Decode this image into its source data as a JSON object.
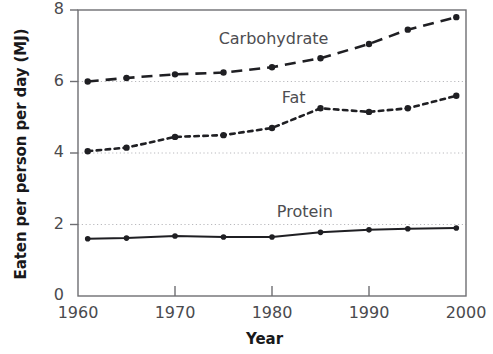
{
  "chart_data": {
    "type": "line",
    "title": "",
    "xlabel": "Year",
    "ylabel": "Eaten per person per day (MJ)",
    "xlim": [
      1960,
      2000
    ],
    "ylim": [
      0,
      8
    ],
    "xticks": [
      1960,
      1970,
      1980,
      1990,
      2000
    ],
    "xtick_labels": [
      "1960",
      "1970",
      "1980",
      "1990",
      "2000"
    ],
    "yticks": [
      0,
      2,
      4,
      6,
      8
    ],
    "ytick_labels": [
      "0",
      "2",
      "4",
      "6",
      "8"
    ],
    "grid": "horizontal dotted gridlines at y = 2, 4 and 6",
    "legend_position": "inline labels next to each series",
    "series": [
      {
        "name": "Carbohydrate",
        "label": "Carbohydrate",
        "style": "dashed",
        "x": [
          1961,
          1965,
          1970,
          1975,
          1980,
          1985,
          1990,
          1994,
          1999
        ],
        "values": [
          6.0,
          6.1,
          6.2,
          6.25,
          6.4,
          6.65,
          7.05,
          7.45,
          7.8
        ]
      },
      {
        "name": "Fat",
        "label": "Fat",
        "style": "dotted",
        "x": [
          1961,
          1965,
          1970,
          1975,
          1980,
          1985,
          1990,
          1994,
          1999
        ],
        "values": [
          4.05,
          4.15,
          4.45,
          4.5,
          4.7,
          5.25,
          5.15,
          5.25,
          5.6
        ]
      },
      {
        "name": "Protein",
        "label": "Protein",
        "style": "solid",
        "x": [
          1961,
          1965,
          1970,
          1975,
          1980,
          1985,
          1990,
          1994,
          1999
        ],
        "values": [
          1.6,
          1.62,
          1.68,
          1.65,
          1.65,
          1.78,
          1.85,
          1.88,
          1.9
        ]
      }
    ],
    "colors": {
      "line": "#1f1f23",
      "gridline": "#b9b9bd",
      "axis": "#6e6e72",
      "text": "#19191b",
      "tick_text": "#4a4a4e",
      "background": "#ffffff"
    }
  },
  "annotations": {
    "carbohydrate_label": "Carbohydrate",
    "fat_label": "Fat",
    "protein_label": "Protein"
  }
}
